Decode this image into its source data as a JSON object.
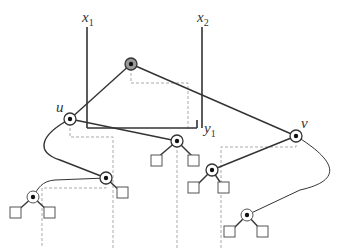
{
  "diagram": {
    "labels": {
      "x1": {
        "base": "x",
        "sub": "1"
      },
      "x2": {
        "base": "x",
        "sub": "2"
      },
      "y1": {
        "base": "y",
        "sub": "1"
      },
      "u": "u",
      "v": "v"
    },
    "colors": {
      "stroke": "#333333",
      "dashed": "#aaaaaa",
      "root_fill": "#999999",
      "node_fill": "#ffffff"
    },
    "nodes": [
      {
        "id": "root",
        "x": 131,
        "y": 64,
        "type": "gray-circle"
      },
      {
        "id": "u",
        "x": 70,
        "y": 119,
        "type": "circle"
      },
      {
        "id": "v",
        "x": 296,
        "y": 136,
        "type": "circle"
      },
      {
        "id": "n1",
        "x": 177,
        "y": 141,
        "type": "circle"
      },
      {
        "id": "n2",
        "x": 106,
        "y": 178,
        "type": "circle"
      },
      {
        "id": "n3",
        "x": 33,
        "y": 197,
        "type": "circle"
      },
      {
        "id": "n4",
        "x": 212,
        "y": 170,
        "type": "circle"
      },
      {
        "id": "n5",
        "x": 247,
        "y": 215,
        "type": "circle"
      }
    ],
    "leaves": [
      {
        "x": 157,
        "y": 158
      },
      {
        "x": 194,
        "y": 158
      },
      {
        "x": 122,
        "y": 193
      },
      {
        "x": 15,
        "y": 213
      },
      {
        "x": 50,
        "y": 213
      },
      {
        "x": 194,
        "y": 188
      },
      {
        "x": 224,
        "y": 188
      },
      {
        "x": 230,
        "y": 232
      },
      {
        "x": 263,
        "y": 232
      }
    ]
  }
}
